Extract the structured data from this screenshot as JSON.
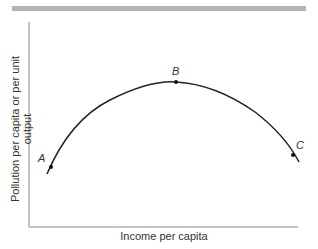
{
  "figure": {
    "y_axis_label": "Pollution per capita or per unit output",
    "x_axis_label": "Income per capita",
    "points": [
      {
        "label": "A"
      },
      {
        "label": "B"
      },
      {
        "label": "C"
      }
    ],
    "colors": {
      "curve": "#222222",
      "axis": "#888888",
      "top_bar": "#b4b4b4"
    }
  }
}
